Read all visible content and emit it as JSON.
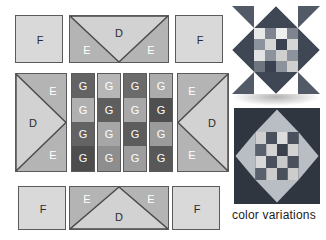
{
  "diagram": {
    "caption": "color variations",
    "labels": {
      "F": "F",
      "E": "E",
      "D": "D",
      "G": "G"
    },
    "colors": {
      "background": "#ffffff",
      "outline": "#555555",
      "F_light": "#d9d9d9",
      "D_light": "#d2d2d2",
      "E_medium": "#b4b4b4",
      "G_dark": "#636363",
      "G_mid": "#9b9b9b",
      "G_light": "#c2c2c2",
      "G_darker": "#4d4d4d",
      "star_dark": "#3d4350",
      "star_mid": "#7b828c",
      "star_light": "#d8d8d8",
      "star_white": "#efefef",
      "star2_dark": "#2f3640",
      "star2_mid": "#9aa0a6",
      "star2_light": "#d2d2d2"
    },
    "rows": [
      {
        "name": "top-row",
        "units": [
          {
            "type": "square",
            "label": "F"
          },
          {
            "type": "flying-geese-down",
            "labels": [
              "E",
              "D",
              "E"
            ]
          },
          {
            "type": "square",
            "label": "F"
          }
        ]
      },
      {
        "name": "middle-row",
        "units": [
          {
            "type": "flying-geese-right",
            "labels": [
              "E",
              "D",
              "E"
            ]
          },
          {
            "type": "nine-patch-column",
            "label": "G",
            "cells": [
              "dark",
              "light",
              "dark",
              "light"
            ]
          },
          {
            "type": "nine-patch-column",
            "label": "G",
            "cells": [
              "light",
              "dark",
              "light",
              "dark"
            ]
          },
          {
            "type": "nine-patch-column",
            "label": "G",
            "cells": [
              "dark",
              "light",
              "dark",
              "light"
            ]
          },
          {
            "type": "nine-patch-column",
            "label": "G",
            "cells": [
              "light",
              "dark",
              "light",
              "dark"
            ]
          },
          {
            "type": "flying-geese-left",
            "labels": [
              "E",
              "D",
              "E"
            ]
          }
        ]
      },
      {
        "name": "bottom-row",
        "units": [
          {
            "type": "square",
            "label": "F"
          },
          {
            "type": "flying-geese-up",
            "labels": [
              "E",
              "D",
              "E"
            ]
          },
          {
            "type": "square",
            "label": "F"
          }
        ]
      }
    ],
    "variations": [
      {
        "name": "star-variation-top",
        "style": "light-background"
      },
      {
        "name": "star-variation-bottom",
        "style": "dark-background"
      }
    ]
  }
}
